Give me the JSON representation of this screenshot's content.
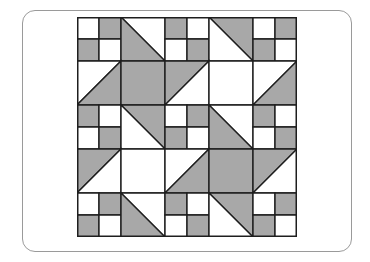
{
  "figure": {
    "type": "quilt-pattern",
    "grid": {
      "rows": 5,
      "cols": 5,
      "unit_px": 44
    },
    "colors": {
      "light": "#ffffff",
      "dark": "#a8a8a8",
      "stroke": "#1e1e1e",
      "card_border": "#9a9a9a"
    },
    "cells": [
      [
        {
          "kind": "four",
          "q": [
            "L",
            "D",
            "D",
            "L"
          ]
        },
        {
          "kind": "diag-down",
          "upper": "L",
          "lower": "D"
        },
        {
          "kind": "four",
          "q": [
            "D",
            "L",
            "L",
            "D"
          ]
        },
        {
          "kind": "diag-down",
          "upper": "D",
          "lower": "L"
        },
        {
          "kind": "four",
          "q": [
            "L",
            "D",
            "D",
            "L"
          ]
        }
      ],
      [
        {
          "kind": "diag-up",
          "upper": "L",
          "lower": "D"
        },
        {
          "kind": "solid",
          "fill": "D"
        },
        {
          "kind": "diag-up",
          "upper": "D",
          "lower": "L"
        },
        {
          "kind": "solid",
          "fill": "L"
        },
        {
          "kind": "diag-up",
          "upper": "L",
          "lower": "D"
        }
      ],
      [
        {
          "kind": "four",
          "q": [
            "D",
            "L",
            "L",
            "D"
          ]
        },
        {
          "kind": "diag-down",
          "upper": "D",
          "lower": "L"
        },
        {
          "kind": "four",
          "q": [
            "L",
            "D",
            "D",
            "L"
          ]
        },
        {
          "kind": "diag-down",
          "upper": "L",
          "lower": "D"
        },
        {
          "kind": "four",
          "q": [
            "D",
            "L",
            "L",
            "D"
          ]
        }
      ],
      [
        {
          "kind": "diag-up",
          "upper": "D",
          "lower": "L"
        },
        {
          "kind": "solid",
          "fill": "L"
        },
        {
          "kind": "diag-up",
          "upper": "L",
          "lower": "D"
        },
        {
          "kind": "solid",
          "fill": "D"
        },
        {
          "kind": "diag-up",
          "upper": "D",
          "lower": "L"
        }
      ],
      [
        {
          "kind": "four",
          "q": [
            "L",
            "D",
            "D",
            "L"
          ]
        },
        {
          "kind": "diag-down",
          "upper": "L",
          "lower": "D"
        },
        {
          "kind": "four",
          "q": [
            "D",
            "L",
            "L",
            "D"
          ]
        },
        {
          "kind": "diag-down",
          "upper": "D",
          "lower": "L"
        },
        {
          "kind": "four",
          "q": [
            "L",
            "D",
            "D",
            "L"
          ]
        }
      ]
    ]
  }
}
